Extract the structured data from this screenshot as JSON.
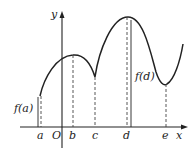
{
  "diagram": {
    "type": "function-graph",
    "axes": {
      "x_label": "x",
      "y_label": "y",
      "origin_label": "O"
    },
    "x_ticks": [
      {
        "label": "a",
        "x": 40
      },
      {
        "label": "b",
        "x": 72
      },
      {
        "label": "c",
        "x": 95
      },
      {
        "label": "d",
        "x": 127
      },
      {
        "label": "e",
        "x": 166
      }
    ],
    "annotations": {
      "fa": "f(a)",
      "fd": "f(d)"
    },
    "colors": {
      "curve": "#222222",
      "axis": "#222222",
      "dashed": "#444444"
    }
  }
}
